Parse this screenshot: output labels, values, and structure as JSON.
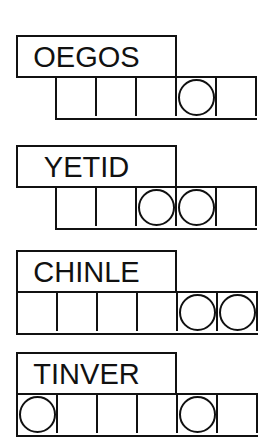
{
  "puzzles": [
    {
      "scrambled": "OEGOS",
      "answer_length": 5,
      "circled_positions": [
        4
      ],
      "answer": [
        "",
        "",
        "",
        "",
        ""
      ]
    },
    {
      "scrambled": "YETID",
      "answer_length": 5,
      "circled_positions": [
        3,
        4
      ],
      "answer": [
        "",
        "",
        "",
        "",
        ""
      ]
    },
    {
      "scrambled": "CHINLE",
      "answer_length": 6,
      "circled_positions": [
        5,
        6
      ],
      "answer": [
        "",
        "",
        "",
        "",
        "",
        ""
      ]
    },
    {
      "scrambled": "TINVER",
      "answer_length": 6,
      "circled_positions": [
        1,
        5
      ],
      "answer": [
        "",
        "",
        "",
        "",
        "",
        ""
      ]
    }
  ],
  "colors": {
    "ink": "#111111",
    "background": "#ffffff"
  }
}
